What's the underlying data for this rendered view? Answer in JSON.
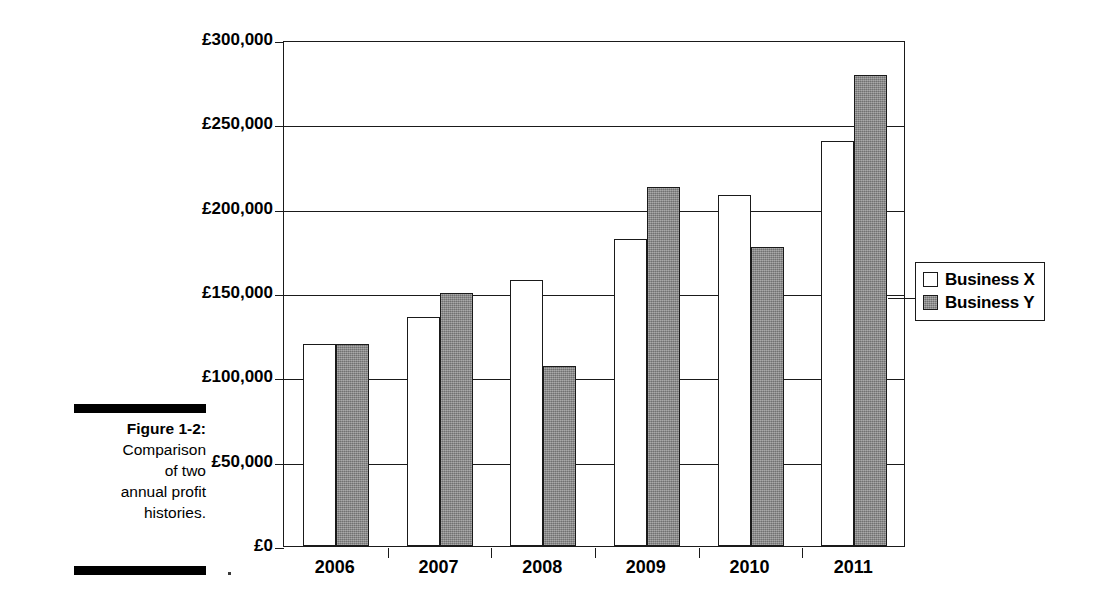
{
  "figure": {
    "label": "Figure 1-2:",
    "caption_lines": [
      "Comparison",
      "of two",
      "annual profit",
      "histories."
    ],
    "caption_full": "Figure 1-2: Comparison of two annual profit histories."
  },
  "legend": {
    "position": "right",
    "entries": [
      {
        "name": "Business X",
        "swatch": "white-square",
        "color": "#ffffff"
      },
      {
        "name": "Business Y",
        "swatch": "gray-square",
        "color": "#8a8a8a"
      }
    ]
  },
  "axis": {
    "y_ticks": [
      "£0",
      "£50,000",
      "£100,000",
      "£150,000",
      "£200,000",
      "£250,000",
      "£300,000"
    ],
    "x_ticks": [
      "2006",
      "2007",
      "2008",
      "2009",
      "2010",
      "2011"
    ]
  },
  "chart_data": {
    "type": "bar",
    "title": "",
    "subtitle": "",
    "xlabel": "",
    "ylabel": "",
    "categories": [
      "2006",
      "2007",
      "2008",
      "2009",
      "2010",
      "2011"
    ],
    "series": [
      {
        "name": "Business X",
        "color": "#ffffff",
        "values": [
          120000,
          136000,
          158000,
          182000,
          208000,
          240000
        ]
      },
      {
        "name": "Business Y",
        "color": "#8a8a8a",
        "values": [
          120000,
          150000,
          107000,
          213000,
          177000,
          279000
        ]
      }
    ],
    "ylim": [
      0,
      300000
    ],
    "ytick_values": [
      0,
      50000,
      100000,
      150000,
      200000,
      250000,
      300000
    ],
    "ytick_labels": [
      "£0",
      "£50,000",
      "£100,000",
      "£150,000",
      "£200,000",
      "£250,000",
      "£300,000"
    ],
    "currency": "GBP",
    "currency_symbol": "£",
    "grid": true,
    "grid_axis": "y",
    "legend_position": "right",
    "bar_grouping": "grouped-adjacent"
  }
}
